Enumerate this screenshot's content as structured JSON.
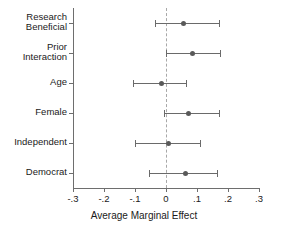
{
  "chart_data": {
    "type": "scatter",
    "subtype": "coefficient-plot",
    "title": "",
    "xlabel": "Average Marginal Effect",
    "ylabel": "",
    "xlim": [
      -0.3,
      0.3
    ],
    "grid": false,
    "legend": null,
    "zero_reference_line": 0,
    "xticks": [
      -0.3,
      -0.2,
      -0.1,
      0,
      0.1,
      0.2,
      0.3
    ],
    "xticklabels": [
      "-.3",
      "-.2",
      "-.1",
      "0",
      ".1",
      ".2",
      ".3"
    ],
    "categories": [
      "Research\nBeneficial",
      "Prior\nInteraction",
      "Age",
      "Female",
      "Independent",
      "Democrat"
    ],
    "points": [
      {
        "label": "Research Beneficial",
        "estimate": 0.055,
        "ci_low": -0.035,
        "ci_high": 0.17
      },
      {
        "label": "Prior Interaction",
        "estimate": 0.085,
        "ci_low": 0.0,
        "ci_high": 0.175
      },
      {
        "label": "Age",
        "estimate": -0.015,
        "ci_low": -0.105,
        "ci_high": 0.065
      },
      {
        "label": "Female",
        "estimate": 0.07,
        "ci_low": -0.005,
        "ci_high": 0.17
      },
      {
        "label": "Independent",
        "estimate": 0.005,
        "ci_low": -0.1,
        "ci_high": 0.11
      },
      {
        "label": "Democrat",
        "estimate": 0.06,
        "ci_low": -0.055,
        "ci_high": 0.165
      }
    ],
    "colors": {
      "point": "#595959",
      "interval": "#6a6a6a",
      "axis": "#6e6e6e",
      "zero_line": "#a8a8a8",
      "background": "#ffffff",
      "text": "#1a1a1a"
    }
  }
}
